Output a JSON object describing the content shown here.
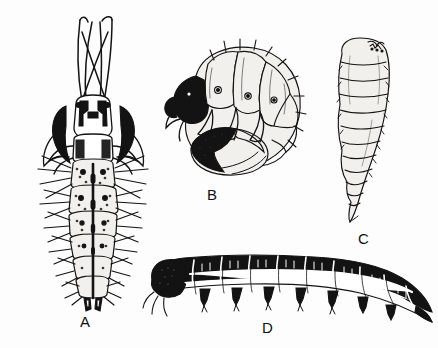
{
  "plate": {
    "title": "Insect larval types",
    "background_color": "#fdfdfd",
    "ink_color": "#131313",
    "width": 438,
    "height": 348
  },
  "figures": [
    {
      "id": "A",
      "label": "A",
      "name": "campodeiform-larva",
      "description": "Elongate flattened larva, dorsal view, with long forked antennae, prominent mandibles, segmented abdomen and lateral setae",
      "label_x": 80,
      "label_y": 314,
      "orientation": "dorsal",
      "legs": "three pairs thoracic",
      "setae": "dense lateral bristles"
    },
    {
      "id": "B",
      "label": "B",
      "name": "scarabaeiform-grub",
      "description": "C-shaped white grub, lateral view, dark head capsule, three pairs thoracic legs, swollen dark ventral abdomen",
      "label_x": 207,
      "label_y": 187,
      "orientation": "lateral",
      "legs": "three pairs thoracic",
      "setae": "sparse dorsal bristles"
    },
    {
      "id": "C",
      "label": "C",
      "name": "vermiform-larva",
      "description": "Legless maggot-like larva, tapering posteriorly, distinct transverse segment folds",
      "label_x": 358,
      "label_y": 231,
      "orientation": "lateral",
      "legs": "none",
      "setae": "none"
    },
    {
      "id": "D",
      "label": "D",
      "name": "eruciform-larva",
      "description": "Elongate caterpillar-like larva, dark banded segments, rounded head, thoracic legs and prolegs",
      "label_x": 262,
      "label_y": 320,
      "orientation": "lateral",
      "legs": "thoracic legs and prolegs",
      "setae": "short bristles"
    }
  ]
}
